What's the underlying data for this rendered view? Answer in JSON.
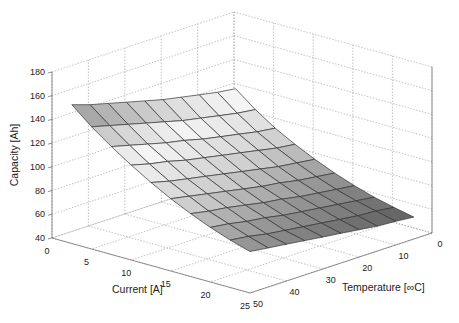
{
  "chart_data": {
    "type": "surface3d",
    "title": "",
    "xlabel": "Current [A]",
    "ylabel": "Temperature [∞C]",
    "zlabel": "Capacity [Ah]",
    "x_ticks": [
      0,
      5,
      10,
      15,
      20,
      25
    ],
    "y_ticks": [
      0,
      10,
      20,
      30,
      40,
      50
    ],
    "z_ticks": [
      40,
      60,
      80,
      100,
      120,
      140,
      160,
      180
    ],
    "xlim": [
      0,
      25
    ],
    "ylim": [
      0,
      50
    ],
    "zlim": [
      40,
      180
    ],
    "grid": true,
    "colormap": "gray",
    "x": [
      2.5,
      5,
      7.5,
      10,
      12.5,
      15,
      17.5,
      20,
      22.5,
      25
    ],
    "y": [
      5,
      10,
      15,
      20,
      25,
      30,
      35,
      40,
      45,
      50
    ],
    "z": [
      [
        125,
        127,
        130,
        133,
        136,
        140,
        144,
        148,
        152,
        157
      ],
      [
        112,
        114,
        117,
        120,
        123,
        127,
        131,
        135,
        139,
        143
      ],
      [
        101,
        103,
        106,
        109,
        112,
        116,
        119,
        123,
        127,
        131
      ],
      [
        92,
        94,
        97,
        100,
        103,
        106,
        109,
        113,
        116,
        120
      ],
      [
        84,
        86,
        88,
        91,
        94,
        97,
        100,
        103,
        106,
        110
      ],
      [
        77,
        79,
        81,
        84,
        86,
        89,
        92,
        95,
        98,
        101
      ],
      [
        71,
        73,
        75,
        77,
        80,
        82,
        85,
        88,
        90,
        93
      ],
      [
        66,
        68,
        70,
        72,
        74,
        76,
        79,
        81,
        84,
        86
      ],
      [
        62,
        64,
        65,
        67,
        69,
        71,
        73,
        75,
        78,
        80
      ],
      [
        58.5,
        60,
        61,
        63,
        65,
        67,
        69,
        71,
        73,
        75
      ]
    ],
    "z_layout": "rows indexed by x (current), columns indexed by y (temperature)"
  }
}
